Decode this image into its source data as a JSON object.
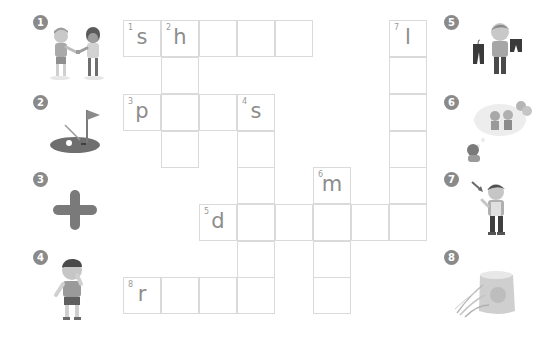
{
  "puzzle": {
    "type": "crossword",
    "cell_width": 38,
    "cell_height": 37,
    "origin_x": 123,
    "origin_y": 20
  },
  "clues": [
    {
      "number": "1",
      "picture": "two boys shaking hands",
      "icon": "handshake-boys-icon",
      "side": "left"
    },
    {
      "number": "2",
      "picture": "golf green with flag and ball",
      "icon": "golf-icon",
      "side": "left"
    },
    {
      "number": "3",
      "picture": "plus sign",
      "icon": "plus-icon",
      "side": "left"
    },
    {
      "number": "4",
      "picture": "boy sneezing / blowing nose",
      "icon": "sick-boy-icon",
      "side": "left"
    },
    {
      "number": "5",
      "picture": "boy holding two pairs of pants",
      "icon": "pants-boy-icon",
      "side": "right"
    },
    {
      "number": "6",
      "picture": "child dreaming of a party",
      "icon": "dream-icon",
      "side": "right"
    },
    {
      "number": "7",
      "picture": "boy pointing at himself",
      "icon": "pointing-boy-icon",
      "side": "right"
    },
    {
      "number": "8",
      "picture": "sack of rice with rice plants",
      "icon": "rice-sack-icon",
      "side": "right"
    }
  ],
  "cells": [
    {
      "r": 0,
      "c": 0,
      "num": "1",
      "letter": "s"
    },
    {
      "r": 0,
      "c": 1,
      "num": "2",
      "letter": "h"
    },
    {
      "r": 0,
      "c": 2,
      "num": "",
      "letter": ""
    },
    {
      "r": 0,
      "c": 3,
      "num": "",
      "letter": ""
    },
    {
      "r": 0,
      "c": 4,
      "num": "",
      "letter": ""
    },
    {
      "r": 0,
      "c": 7,
      "num": "7",
      "letter": "l"
    },
    {
      "r": 1,
      "c": 1,
      "num": "",
      "letter": ""
    },
    {
      "r": 1,
      "c": 7,
      "num": "",
      "letter": ""
    },
    {
      "r": 2,
      "c": 0,
      "num": "3",
      "letter": "p"
    },
    {
      "r": 2,
      "c": 1,
      "num": "",
      "letter": ""
    },
    {
      "r": 2,
      "c": 2,
      "num": "",
      "letter": ""
    },
    {
      "r": 2,
      "c": 3,
      "num": "4",
      "letter": "s"
    },
    {
      "r": 2,
      "c": 7,
      "num": "",
      "letter": ""
    },
    {
      "r": 3,
      "c": 1,
      "num": "",
      "letter": ""
    },
    {
      "r": 3,
      "c": 3,
      "num": "",
      "letter": ""
    },
    {
      "r": 3,
      "c": 7,
      "num": "",
      "letter": ""
    },
    {
      "r": 4,
      "c": 3,
      "num": "",
      "letter": ""
    },
    {
      "r": 4,
      "c": 5,
      "num": "6",
      "letter": "m"
    },
    {
      "r": 4,
      "c": 7,
      "num": "",
      "letter": ""
    },
    {
      "r": 5,
      "c": 2,
      "num": "5",
      "letter": "d"
    },
    {
      "r": 5,
      "c": 3,
      "num": "",
      "letter": ""
    },
    {
      "r": 5,
      "c": 4,
      "num": "",
      "letter": ""
    },
    {
      "r": 5,
      "c": 5,
      "num": "",
      "letter": ""
    },
    {
      "r": 5,
      "c": 6,
      "num": "",
      "letter": ""
    },
    {
      "r": 5,
      "c": 7,
      "num": "",
      "letter": ""
    },
    {
      "r": 6,
      "c": 3,
      "num": "",
      "letter": ""
    },
    {
      "r": 6,
      "c": 5,
      "num": "",
      "letter": ""
    },
    {
      "r": 7,
      "c": 0,
      "num": "8",
      "letter": "r"
    },
    {
      "r": 7,
      "c": 1,
      "num": "",
      "letter": ""
    },
    {
      "r": 7,
      "c": 2,
      "num": "",
      "letter": ""
    },
    {
      "r": 7,
      "c": 3,
      "num": "",
      "letter": ""
    },
    {
      "r": 7,
      "c": 5,
      "num": "",
      "letter": ""
    }
  ],
  "colors": {
    "badge": "#8a8a8a",
    "grid_line": "#dadada",
    "letter": "#8c8c8c"
  }
}
